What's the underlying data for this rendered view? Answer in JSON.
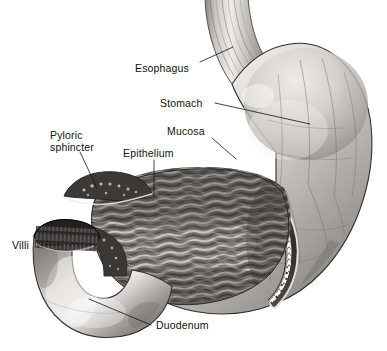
{
  "figure": {
    "background_color": "#ffffff",
    "ink_color": "#111111",
    "style": "grayscale pen-and-ink medical illustration, sagittal cutaway"
  },
  "labels": {
    "esophagus": {
      "text": "Esophagus"
    },
    "stomach": {
      "text": "Stomach"
    },
    "pyloric_sphincter": {
      "line1": "Pyloric",
      "line2": "sphincter"
    },
    "epithelium": {
      "text": "Epithelium"
    },
    "mucosa": {
      "text": "Mucosa"
    },
    "villi": {
      "text": "Villi"
    },
    "duodenum": {
      "text": "Duodenum"
    }
  },
  "structures": {
    "esophagus": {
      "name": "esophagus",
      "description": "ridged tube entering stomach at upper left, vertical striations"
    },
    "fundus": {
      "name": "fundus",
      "description": "rounded dome at upper right of stomach"
    },
    "body": {
      "name": "stomach-body",
      "description": "large smooth-walled sac with fine serosal vessels"
    },
    "rugae": {
      "name": "rugae",
      "description": "dense wavy mucosal folds lining cut interior"
    },
    "wall_layers": {
      "name": "stomach-wall-layers",
      "description": "serosa, muscularis and beaded mucosa bands at cut edge"
    },
    "pylorus": {
      "name": "pyloric-sphincter",
      "description": "thick muscular ring between stomach and duodenum"
    },
    "duodenum": {
      "name": "duodenum",
      "description": "curved tube descending from pylorus, bright highlight"
    },
    "villi": {
      "name": "villi",
      "description": "dark fringed lining at cut duodenal opening"
    }
  },
  "palette": {
    "wall_light": "#e8e6e2",
    "wall_mid": "#b9b6b1",
    "wall_dark": "#7d7a76",
    "interior_dark": "#5c5954",
    "rugae_light": "#cfccc6",
    "rugae_dark": "#4a4743",
    "muscle_dark": "#3a3835",
    "outline": "#2b2a28"
  }
}
